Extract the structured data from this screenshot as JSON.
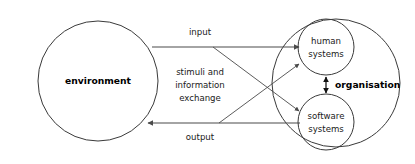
{
  "diagram": {
    "type": "system-context-diagram",
    "background_color": "#ffffff",
    "stroke_color": "#3a3a3a",
    "text_color": "#1a1a1a",
    "nodes": {
      "environment": {
        "label": "environment",
        "shape": "circle",
        "bold": true,
        "cx": 98,
        "cy": 81,
        "r": 60
      },
      "organisation_boundary": {
        "label": "organisation",
        "shape": "circle",
        "bold": true,
        "cx": 336,
        "cy": 83,
        "r": 64
      },
      "human_systems": {
        "label_line_1": "human",
        "label_line_2": "systems",
        "shape": "circle",
        "cx": 326,
        "cy": 47,
        "r": 28
      },
      "software_systems": {
        "label_line_1": "software",
        "label_line_2": "systems",
        "shape": "circle",
        "cx": 326,
        "cy": 122,
        "r": 28
      }
    },
    "edges": {
      "input": {
        "label": "input",
        "from": "environment",
        "to": "human_systems",
        "direction": "right"
      },
      "output": {
        "label": "output",
        "from": "software_systems",
        "to": "environment",
        "direction": "left"
      },
      "stimuli": {
        "label_line_1": "stimuli and",
        "label_line_2": "information",
        "label_line_3": "exchange",
        "description": "crossing diagonal exchange arrows"
      },
      "organisation_link": {
        "label": "organisation",
        "from": "human_systems",
        "to": "software_systems",
        "direction": "both"
      }
    }
  }
}
